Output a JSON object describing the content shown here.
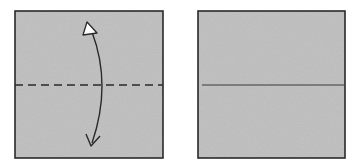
{
  "diagram": {
    "type": "origami-instructions",
    "steps": [
      {
        "id": "step-1",
        "description": "Square paper with horizontal valley-fold line (dashed) and a two-way fold-and-unfold arrow",
        "fold_line": "dashed",
        "arrow": "fold-and-unfold"
      },
      {
        "id": "step-2",
        "description": "Square paper with horizontal crease line (solid) after unfolding",
        "fold_line": "solid"
      }
    ],
    "colors": {
      "paper": "#b9b9b9",
      "outline": "#2a2a2a",
      "line": "#2a2a2a",
      "arrowhead_fill": "#ffffff",
      "background": "#ffffff"
    }
  }
}
